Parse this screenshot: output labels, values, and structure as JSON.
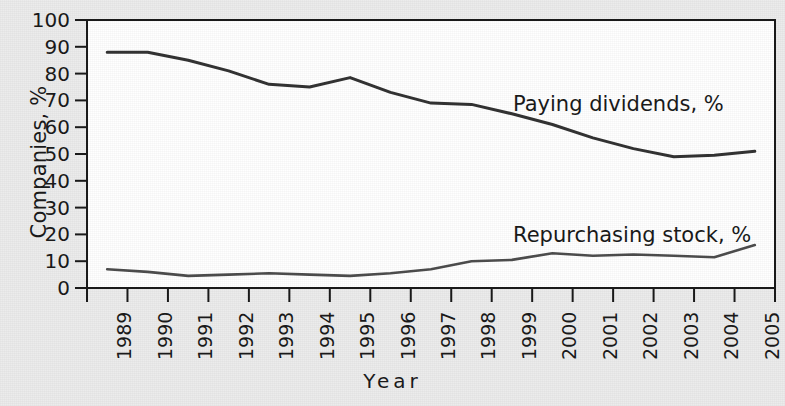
{
  "chart_data": {
    "type": "line",
    "title": "",
    "xlabel": "Year",
    "ylabel": "Companies, %",
    "xlim": [
      1989,
      2005
    ],
    "ylim": [
      0,
      100
    ],
    "grid": false,
    "legend_position": "inline-annotation",
    "categories": [
      1989,
      1990,
      1991,
      1992,
      1993,
      1994,
      1995,
      1996,
      1997,
      1998,
      1999,
      2000,
      2001,
      2002,
      2003,
      2004,
      2005
    ],
    "ytick_labels": [
      "100",
      "90",
      "80",
      "70",
      "60",
      "50",
      "40",
      "30",
      "20",
      "10",
      "0"
    ],
    "xtick_labels": [
      "1989",
      "1990",
      "1991",
      "1992",
      "1993",
      "1994",
      "1995",
      "1996",
      "1997",
      "1998",
      "1999",
      "2000",
      "2001",
      "2002",
      "2003",
      "2004",
      "2005"
    ],
    "series": [
      {
        "name": "Paying dividends, %",
        "values": [
          88,
          88,
          85,
          81,
          76,
          75,
          78.5,
          73,
          69,
          68.5,
          65,
          61,
          56,
          52,
          49,
          49.5,
          51
        ],
        "color": "#333333",
        "annotation": "Paying dividends, %"
      },
      {
        "name": "Repurchasing stock, %",
        "values": [
          7,
          6,
          4.5,
          5,
          5.5,
          5,
          4.5,
          5.5,
          7,
          10,
          10.5,
          13,
          12,
          12.5,
          12,
          11.5,
          16
        ],
        "color": "#4d4d4d",
        "annotation": "Repurchasing stock, %"
      }
    ]
  },
  "annotations": {
    "upper": "Paying dividends, %",
    "lower": "Repurchasing stock, %"
  },
  "axes": {
    "y_title": "Companies, %",
    "x_title": "Year"
  },
  "colors": {
    "background": "#ececec",
    "plot_background": "#ffffff",
    "axis": "#1a1a1a",
    "series_upper": "#333333",
    "series_lower": "#4d4d4d"
  }
}
